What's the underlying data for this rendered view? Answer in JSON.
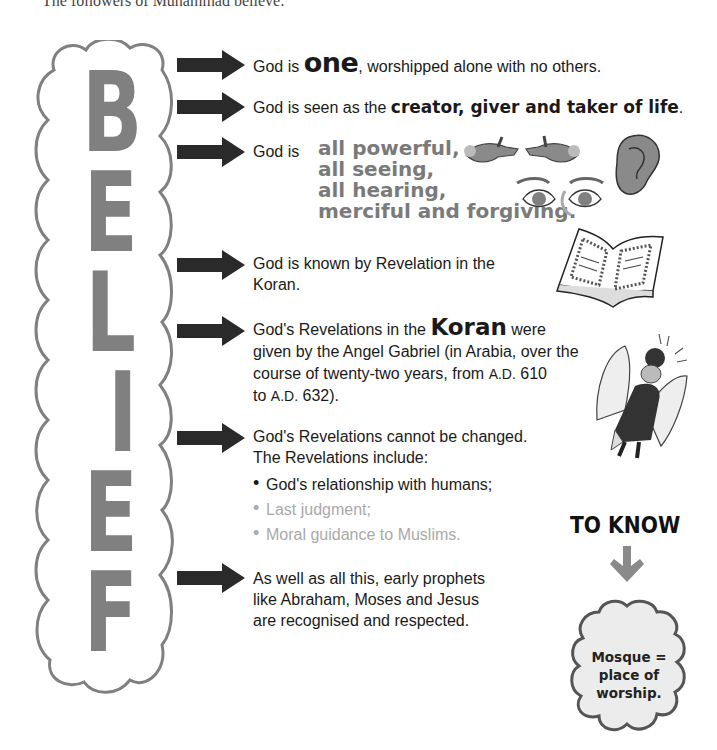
{
  "intro": "The followers of Muhammad believe:",
  "column_word": {
    "title": "BELIEF",
    "letters": [
      "B",
      "E",
      "L",
      "I",
      "E",
      "F"
    ],
    "letter_color": "#808080",
    "outline_color": "#808080"
  },
  "statements": [
    {
      "pre": "God is ",
      "emphasis": "one",
      "post": ", worshipped alone with no others."
    },
    {
      "pre": "God is seen as the ",
      "emphasis": "creator, giver and taker of life",
      "post": "."
    },
    {
      "pre": "God is",
      "attributes": [
        "all powerful,",
        "all seeing,",
        "all hearing,",
        "merciful and forgiving."
      ]
    },
    {
      "lines": [
        "God is known by Revelation in the",
        "Koran."
      ]
    },
    {
      "pre": "God's Revelations in the ",
      "emphasis": "Koran",
      "post": " were",
      "line2": "given by the Angel Gabriel (in Arabia, over the",
      "line3_pre": "course of twenty-two years, from ",
      "era1": "A.D.",
      "year1": " 610",
      "line4_pre": "to ",
      "era2": "A.D.",
      "year2": " 632)."
    },
    {
      "lines": [
        "God's Revelations cannot be changed.",
        "The Revelations include:"
      ],
      "bullets": [
        {
          "text": "God's relationship with humans;",
          "muted": false
        },
        {
          "text": "Last judgment;",
          "muted": true
        },
        {
          "text": "Moral guidance to Muslims.",
          "muted": true
        }
      ]
    },
    {
      "lines": [
        "As well as all this, early prophets",
        "like Abraham, Moses and Jesus",
        "are recognised and respected."
      ]
    }
  ],
  "illustrations": {
    "hands": "hands-icon",
    "ear": "ear-icon",
    "eyes": "eyes-icon",
    "book": "open-book-icon",
    "angel": "angel-icon"
  },
  "to_know": {
    "heading": "TO KNOW",
    "arrow_color": "#8a8a8a",
    "cloud_lines": [
      "Mosque =",
      "place of",
      "worship."
    ],
    "cloud_fill": "#ececec",
    "cloud_stroke": "#555555"
  },
  "colors": {
    "arrow": "#2a2a2a",
    "muted_text": "#a9a9a9",
    "attribute_text": "#7a7a7a"
  }
}
